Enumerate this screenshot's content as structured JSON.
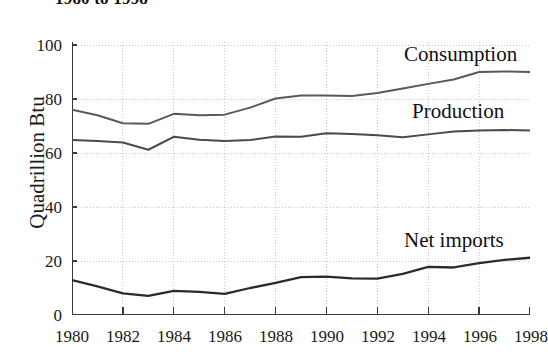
{
  "chart_data": {
    "type": "line",
    "title": "1980 to 1998",
    "xlabel": "",
    "ylabel": "Quadrillion Btu",
    "xlim": [
      1980,
      1998
    ],
    "ylim": [
      0,
      105
    ],
    "yticks": [
      0,
      20,
      40,
      60,
      80,
      100
    ],
    "xticks": [
      1980,
      1982,
      1984,
      1986,
      1988,
      1990,
      1992,
      1994,
      1996,
      1998
    ],
    "grid": true,
    "legend_position": "inline-annotations",
    "x": [
      1980,
      1981,
      1982,
      1983,
      1984,
      1985,
      1986,
      1987,
      1988,
      1989,
      1990,
      1991,
      1992,
      1993,
      1994,
      1995,
      1996,
      1997,
      1998
    ],
    "series": [
      {
        "name": "Consumption",
        "color": "#595959",
        "values": [
          76.0,
          74.0,
          71.0,
          70.8,
          74.5,
          74.0,
          74.2,
          76.8,
          80.2,
          81.3,
          81.3,
          81.1,
          82.2,
          83.9,
          85.6,
          87.2,
          90.0,
          90.2,
          90.0
        ]
      },
      {
        "name": "Production",
        "color": "#4a4a4a",
        "values": [
          64.8,
          64.4,
          63.9,
          61.2,
          66.0,
          64.9,
          64.4,
          64.8,
          66.1,
          66.0,
          67.3,
          67.0,
          66.6,
          65.8,
          66.9,
          68.0,
          68.3,
          68.5,
          68.3
        ]
      },
      {
        "name": "Net imports",
        "color": "#2b2b2b",
        "values": [
          12.9,
          10.6,
          8.0,
          7.1,
          8.9,
          8.6,
          7.8,
          10.0,
          11.9,
          14.0,
          14.2,
          13.6,
          13.5,
          15.2,
          17.8,
          17.6,
          19.2,
          20.4,
          21.2
        ]
      }
    ]
  },
  "axes": {
    "y_title": "Quadrillion Btu",
    "y_tick_labels": [
      "100",
      "80",
      "60",
      "40",
      "20",
      "0"
    ],
    "x_tick_labels": [
      "1980",
      "1982",
      "1984",
      "1986",
      "1988",
      "1990",
      "1992",
      "1994",
      "1996",
      "1998"
    ]
  },
  "annotations": {
    "consumption": "Consumption",
    "production": "Production",
    "net_imports": "Net imports"
  },
  "header": {
    "title": "1980 to 1998"
  },
  "style": {
    "axis_color": "#3a3a3a",
    "grid_color": "#c9c9c9",
    "background": "#ffffff"
  }
}
